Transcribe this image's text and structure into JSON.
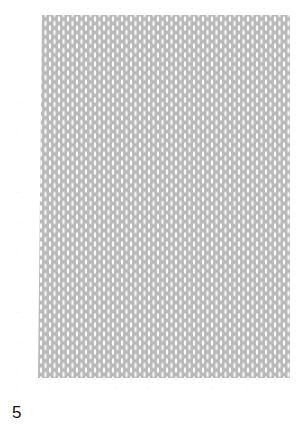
{
  "figure": {
    "panel_label": "5",
    "panel_color": "#b9b9b9",
    "left_ticks": [
      "-",
      "-",
      "-",
      "-",
      "-",
      "-",
      "-",
      "-",
      "-",
      "-",
      "-",
      "-"
    ],
    "bottom_ticks": [
      "-",
      "-",
      "-",
      "-",
      "-",
      "-",
      "-",
      "-"
    ]
  }
}
